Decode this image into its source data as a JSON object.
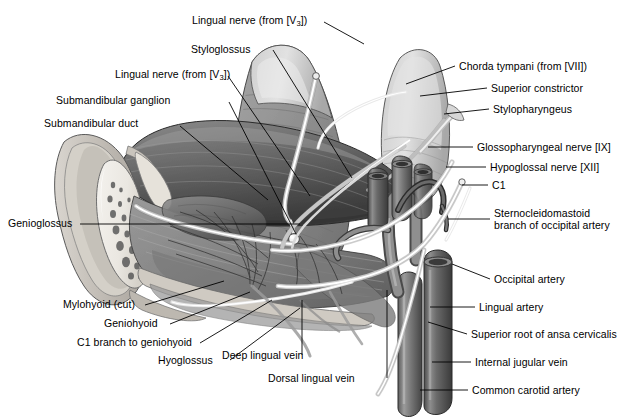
{
  "figure": {
    "background_color": "#ffffff",
    "ink_color": "#000000",
    "width": 626,
    "height": 420
  },
  "labels": {
    "lingual_nerve_v3_top": "Lingual nerve (from [V3])",
    "styloglossus": "Styloglossus",
    "lingual_nerve_v3_mid": "Lingual nerve (from [V3])",
    "submandibular_ganglion": "Submandibular ganglion",
    "submandibular_duct": "Submandibular duct",
    "genioglossus": "Genioglossus",
    "mylohyoid_cut": "Mylohyoid (cut)",
    "geniohyoid": "Geniohyoid",
    "c1_branch_to_geniohyoid": "C1 branch to geniohyoid",
    "hyoglossus": "Hyoglossus",
    "deep_lingual_vein": "Deep lingual vein",
    "dorsal_lingual_vein": "Dorsal lingual vein",
    "chorda_tympani": "Chorda tympani (from [VII])",
    "superior_constrictor": "Superior constrictor",
    "stylopharyngeus": "Stylopharyngeus",
    "glossopharyngeal_nerve": "Glossopharyngeal nerve [IX]",
    "hypoglossal_nerve": "Hypoglossal nerve [XII]",
    "c1": "C1",
    "sternocleidomastoid_branch": "Sternocleidomastoid branch of occipital artery",
    "occipital_artery": "Occipital artery",
    "lingual_artery": "Lingual artery",
    "superior_root_ansa_cervicalis": "Superior root of ansa cervicalis",
    "internal_jugular_vein": "Internal jugular vein",
    "common_carotid_artery": "Common carotid artery"
  },
  "structures": {
    "tongue_body": "tongue-body",
    "mandible_section": "mandible-cross-section",
    "sublingual_gland": "sublingual-gland",
    "vessels": "great-vessels-of-neck"
  }
}
